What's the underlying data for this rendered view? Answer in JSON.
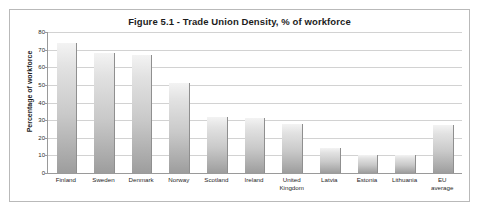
{
  "chart_data": {
    "type": "bar",
    "title": "Figure 5.1 - Trade Union Density, % of workforce",
    "xlabel": "",
    "ylabel": "Percentage of workforce",
    "ylim": [
      0,
      80
    ],
    "ytick_step": 10,
    "yticks": [
      80,
      70,
      60,
      50,
      40,
      30,
      20,
      10,
      0
    ],
    "grid": true,
    "legend": false,
    "categories": [
      "Finland",
      "Sweden",
      "Denmark",
      "Norway",
      "Scotland",
      "Ireland",
      "United\nKingdom",
      "Latvia",
      "Estonia",
      "Lithuania",
      "EU\naverage"
    ],
    "values": [
      74,
      68,
      67,
      51,
      32,
      31,
      28,
      14,
      10,
      10,
      27
    ],
    "bar_color": "#c0c0c0",
    "gridline_color": "#d2d2d2",
    "axis_color": "#9a9a9a"
  }
}
